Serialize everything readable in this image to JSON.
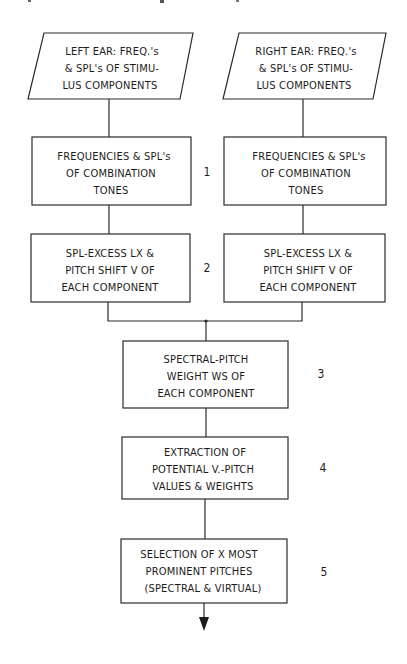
{
  "diagram": {
    "type": "flowchart",
    "colors": {
      "line": "#2a2a2a",
      "text": "#1c1c1c",
      "background": "#ffffff"
    },
    "inputs": {
      "left_ear": {
        "shape": "parallelogram",
        "lines": [
          "LEFT EAR: FREQ.'s",
          "& SPL's OF STIMU-",
          "LUS COMPONENTS"
        ]
      },
      "right_ear": {
        "shape": "parallelogram",
        "lines": [
          "RIGHT EAR: FREQ.'s",
          "& SPL's OF STIMU-",
          "LUS COMPONENTS"
        ]
      }
    },
    "stages": [
      {
        "number": "1",
        "left": {
          "lines": [
            "FREQUENCIES & SPL's",
            "OF COMBINATION",
            "TONES"
          ]
        },
        "right": {
          "lines": [
            "FREQUENCIES & SPL's",
            "OF COMBINATION",
            "TONES"
          ]
        }
      },
      {
        "number": "2",
        "left": {
          "lines": [
            "SPL-EXCESS LX &",
            "PITCH SHIFT V OF",
            "EACH COMPONENT"
          ]
        },
        "right": {
          "lines": [
            "SPL-EXCESS LX &",
            "PITCH SHIFT V OF",
            "EACH COMPONENT"
          ]
        }
      },
      {
        "number": "3",
        "center": {
          "lines": [
            "SPECTRAL-PITCH",
            "WEIGHT WS OF",
            "EACH COMPONENT"
          ]
        }
      },
      {
        "number": "4",
        "center": {
          "lines": [
            "EXTRACTION OF",
            "POTENTIAL V.-PITCH",
            "VALUES & WEIGHTS"
          ]
        }
      },
      {
        "number": "5",
        "center": {
          "lines": [
            "SELECTION OF X MOST",
            "PROMINENT PITCHES",
            "(SPECTRAL & VIRTUAL)"
          ]
        }
      }
    ],
    "output_arrow": "down-arrow"
  }
}
